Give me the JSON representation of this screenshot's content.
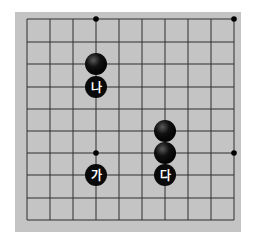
{
  "board": {
    "name": "go-board-fragment",
    "background_color": "#c4c4c4",
    "line_color": "#2e2e2e",
    "page_color": "#ffffff",
    "rect": {
      "x": 15,
      "y": 12,
      "width": 226,
      "height": 220
    },
    "columns_x": [
      27,
      50,
      73,
      96,
      119,
      142,
      165,
      188,
      211,
      234
    ],
    "rows_y": [
      19,
      42,
      64,
      87,
      109,
      131,
      153,
      175,
      198,
      220
    ],
    "edges": {
      "top_is_board_edge": false,
      "bottom_is_board_edge": false,
      "left_is_board_edge": false,
      "right_is_board_edge": false
    }
  },
  "star_points": [
    {
      "col": 3,
      "row": 0
    },
    {
      "col": 9,
      "row": 0
    },
    {
      "col": 3,
      "row": 6
    },
    {
      "col": 9,
      "row": 6
    }
  ],
  "stones": [
    {
      "color": "black",
      "col": 3,
      "row": 2,
      "label": ""
    },
    {
      "color": "black",
      "col": 3,
      "row": 3,
      "label": "나"
    },
    {
      "color": "black",
      "col": 6,
      "row": 5,
      "label": ""
    },
    {
      "color": "black",
      "col": 6,
      "row": 6,
      "label": ""
    },
    {
      "color": "black",
      "col": 6,
      "row": 7,
      "label": "다"
    },
    {
      "color": "black",
      "col": 3,
      "row": 7,
      "label": "가"
    }
  ],
  "stone_style": {
    "radius": 11,
    "fill": "#0a0a0a",
    "highlight": "#5a5a5a",
    "label_color": "#ffffff",
    "label_font_size": 12
  }
}
